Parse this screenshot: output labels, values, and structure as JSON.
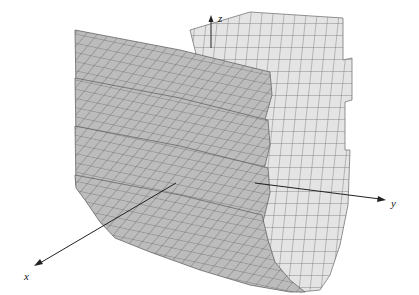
{
  "figure": {
    "axes": {
      "x": {
        "label": "x"
      },
      "y": {
        "label": "y"
      },
      "z": {
        "label": "z"
      }
    },
    "colors": {
      "front_sheet": "#bdbdbd",
      "back_sheet": "#e4e4e4",
      "grid_line": "#6a6a6a",
      "axis": "#222222"
    },
    "layers": 4
  }
}
